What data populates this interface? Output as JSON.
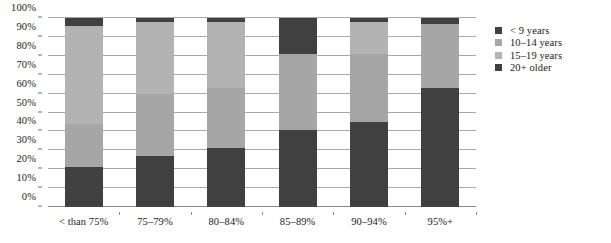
{
  "chart_data": {
    "type": "bar",
    "subtype": "stacked-100-percent",
    "title": "",
    "subtitle": "",
    "xlabel": "",
    "ylabel": "",
    "ylim": [
      0,
      100
    ],
    "ytick_labels": [
      "0%",
      "10%",
      "20%",
      "30%",
      "40%",
      "50%",
      "60%",
      "70%",
      "80%",
      "90%",
      "100%"
    ],
    "ytick_values": [
      0,
      10,
      20,
      30,
      40,
      50,
      60,
      70,
      80,
      90,
      100
    ],
    "grid": true,
    "grid_axis": "y",
    "legend_position": "right",
    "categories": [
      "< than 75%",
      "75–79%",
      "80–84%",
      "85–89%",
      "90–94%",
      "95%+"
    ],
    "series": [
      {
        "name": "< 9 years",
        "color": "#404040",
        "values": [
          21,
          27,
          31,
          41,
          45,
          63
        ]
      },
      {
        "name": "10–14 years",
        "color": "#a6a6a6",
        "values": [
          23,
          33,
          32,
          40,
          36,
          34
        ]
      },
      {
        "name": "15–19 years",
        "color": "#b3b3b3",
        "values": [
          52,
          38,
          35,
          0,
          17,
          0
        ]
      },
      {
        "name": "20+ older",
        "color": "#404040",
        "values": [
          4,
          2,
          2,
          19,
          2,
          3
        ]
      }
    ]
  },
  "legend": {
    "items": [
      {
        "label": "< 9 years",
        "color": "#404040"
      },
      {
        "label": "10–14 years",
        "color": "#a6a6a6"
      },
      {
        "label": "15–19 years",
        "color": "#b3b3b3"
      },
      {
        "label": "20+ older",
        "color": "#404040"
      }
    ]
  },
  "colors": {
    "background": "#ffffff",
    "gridline": "#a8a8a8",
    "axis_text": "#1a1a1a",
    "dark_series": "#404040",
    "mid_gray_series": "#a6a6a6",
    "light_gray_series": "#b3b3b3"
  }
}
